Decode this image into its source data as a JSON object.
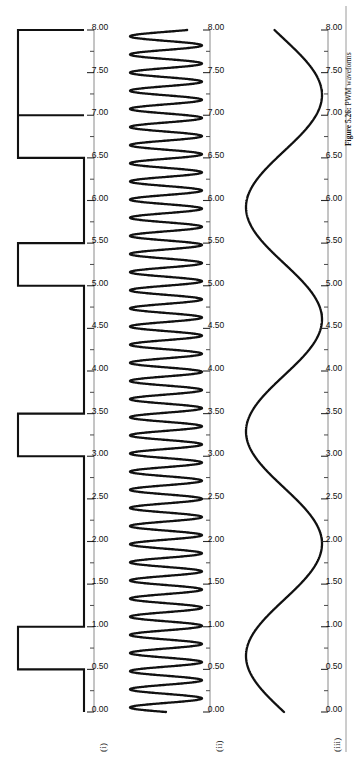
{
  "figure": {
    "caption_label": "Figure 5.26:",
    "caption_text": "PWM waveforms",
    "orientation": "rotated-90-ccw",
    "background": "#ffffff",
    "ink_color": "#111111",
    "axis_color": "#8a8a8a"
  },
  "axis": {
    "label": "",
    "min": 0.0,
    "max": 8.0,
    "major_step": 0.5,
    "minor_step": 0.25,
    "tick_labels": [
      "0.00",
      "0.50",
      "1.00",
      "1.50",
      "2.00",
      "2.50",
      "3.00",
      "3.50",
      "4.00",
      "4.50",
      "5.00",
      "5.50",
      "6.00",
      "6.50",
      "7.00",
      "7.50",
      "8.00"
    ],
    "tick_values": [
      0.0,
      0.5,
      1.0,
      1.5,
      2.0,
      2.5,
      3.0,
      3.5,
      4.0,
      4.5,
      5.0,
      5.5,
      6.0,
      6.5,
      7.0,
      7.5,
      8.0
    ]
  },
  "traces": [
    {
      "id": "i",
      "label": "(i)",
      "kind": "square"
    },
    {
      "id": "ii",
      "label": "(ii)",
      "kind": "sine-hf"
    },
    {
      "id": "iii",
      "label": "(iii)",
      "kind": "sine-lf"
    }
  ],
  "chart_data": {
    "type": "line",
    "title": "",
    "subtitle": "",
    "xlabel": "",
    "ylabel": "",
    "xlim": [
      0.0,
      8.0
    ],
    "grid": false,
    "legend": "none",
    "tick_labels": [
      "0.00",
      "0.50",
      "1.00",
      "1.50",
      "2.00",
      "2.50",
      "3.00",
      "3.50",
      "4.00",
      "4.50",
      "5.00",
      "5.50",
      "6.00",
      "6.50",
      "7.00",
      "7.50",
      "8.00"
    ],
    "series": [
      {
        "name": "(i)",
        "type": "square",
        "description": "Digital PWM gate / switching signal, two-level square wave",
        "ylim": [
          0,
          1
        ],
        "low": 0,
        "high": 1,
        "high_intervals": [
          [
            0.5,
            1.0
          ],
          [
            3.0,
            3.5
          ],
          [
            5.0,
            5.5
          ],
          [
            6.5,
            7.0
          ],
          [
            7.0,
            8.0
          ]
        ],
        "transitions": [
          0.5,
          1.0,
          3.0,
          3.5,
          5.0,
          5.5,
          6.5,
          7.0
        ]
      },
      {
        "name": "(ii)",
        "type": "sine",
        "description": "High-frequency carrier (triangular/sine carrier)",
        "amplitude": 1.0,
        "frequency_cycles_per_unit": 4.7,
        "phase": 0.0,
        "offset": 0.0,
        "ylim": [
          -1,
          1
        ]
      },
      {
        "name": "(iii)",
        "type": "sine",
        "description": "Low-frequency modulating / output waveform",
        "amplitude": 1.0,
        "frequency_cycles_per_unit": 0.38,
        "phase": 0.0,
        "offset": 0.0,
        "ylim": [
          -1,
          1
        ],
        "peaks": [
          0.55,
          3.15,
          5.8
        ],
        "troughs": [
          1.8,
          4.95,
          6.45
        ]
      }
    ]
  }
}
